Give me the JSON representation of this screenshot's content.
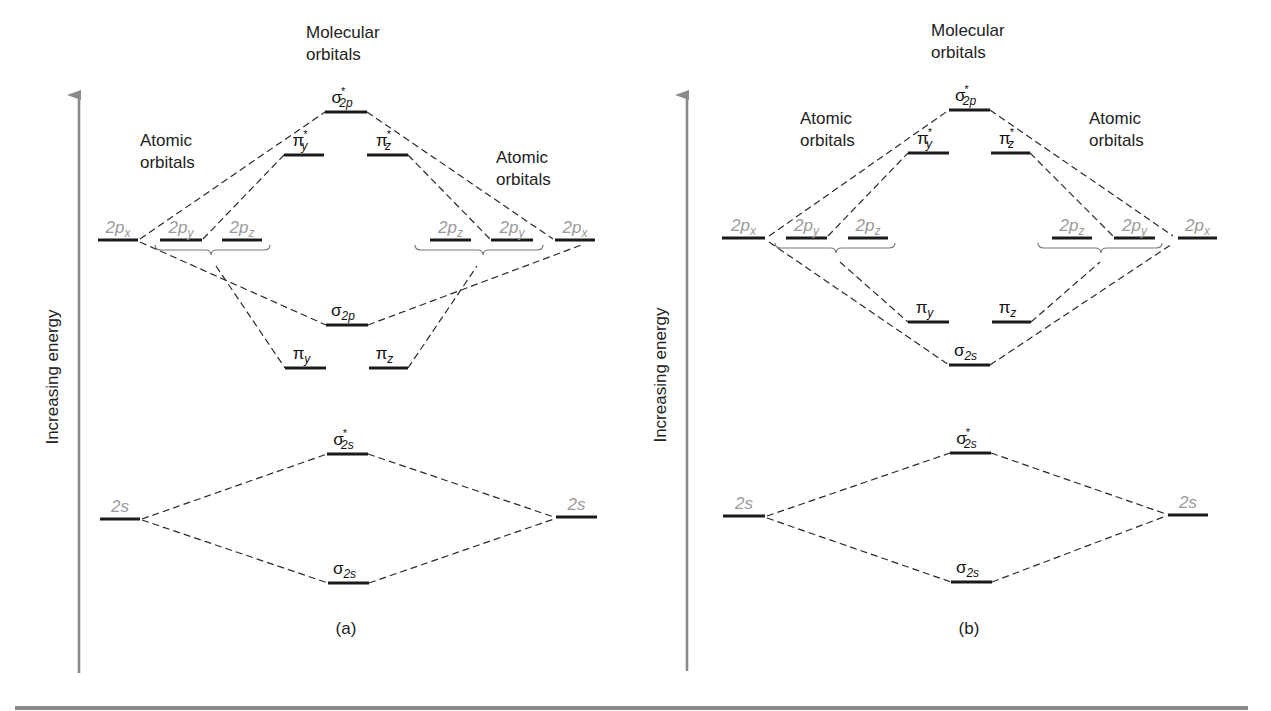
{
  "figure": {
    "axis_label": "Increasing energy",
    "bottom_rule": {
      "x1": 15,
      "x2": 1248,
      "y": 708,
      "color": "#8a8a8a"
    },
    "colors": {
      "level": "#1a1a1a",
      "connector": "#2a2a2a",
      "atomic_label": "#9a9a9a",
      "axis": "#8a8a8a"
    }
  },
  "panels": [
    {
      "id": "a",
      "caption": "(a)",
      "caption_pos": {
        "x": 346,
        "y": 634
      },
      "axis": {
        "x": 79,
        "y_top": 83,
        "y_bottom": 673,
        "label_x": 58,
        "label_y": 377
      },
      "headings": [
        {
          "text": [
            "Molecular",
            "orbitals"
          ],
          "x": 306,
          "y": 38
        },
        {
          "text": [
            "Atomic",
            "orbitals"
          ],
          "x": 140,
          "y": 146
        },
        {
          "text": [
            "Atomic",
            "orbitals"
          ],
          "x": 496,
          "y": 163
        }
      ],
      "atomic_orbitals": [
        {
          "name": "2px-left",
          "label": "2p",
          "sub": "x",
          "x1": 98,
          "x2": 138,
          "y": 240
        },
        {
          "name": "2py-left",
          "label": "2p",
          "sub": "y",
          "x1": 160,
          "x2": 202,
          "y": 240
        },
        {
          "name": "2pz-left",
          "label": "2p",
          "sub": "z",
          "x1": 222,
          "x2": 262,
          "y": 240
        },
        {
          "name": "2pz-right",
          "label": "2p",
          "sub": "z",
          "x1": 430,
          "x2": 471,
          "y": 240
        },
        {
          "name": "2py-right",
          "label": "2p",
          "sub": "y",
          "x1": 491,
          "x2": 533,
          "y": 240
        },
        {
          "name": "2px-right",
          "label": "2p",
          "sub": "x",
          "x1": 555,
          "x2": 595,
          "y": 240
        },
        {
          "name": "2s-left",
          "label": "2s",
          "sub": "",
          "x1": 100,
          "x2": 140,
          "y": 519
        },
        {
          "name": "2s-right",
          "label": "2s",
          "sub": "",
          "x1": 556,
          "x2": 597,
          "y": 517
        }
      ],
      "molecular_orbitals": [
        {
          "name": "sigma-star-2p",
          "symbol": "σ",
          "star": true,
          "sub": "2p",
          "x1": 325,
          "x2": 367,
          "y": 112
        },
        {
          "name": "pi-star-y",
          "symbol": "π",
          "star": true,
          "sub": "y",
          "x1": 284,
          "x2": 324,
          "y": 155
        },
        {
          "name": "pi-star-z",
          "symbol": "π",
          "star": true,
          "sub": "z",
          "x1": 367,
          "x2": 408,
          "y": 155
        },
        {
          "name": "sigma-2p",
          "symbol": "σ",
          "star": false,
          "sub": "2p",
          "x1": 326,
          "x2": 368,
          "y": 325
        },
        {
          "name": "pi-y",
          "symbol": "π",
          "star": false,
          "sub": "y",
          "x1": 285,
          "x2": 326,
          "y": 368
        },
        {
          "name": "pi-z",
          "symbol": "π",
          "star": false,
          "sub": "z",
          "x1": 369,
          "x2": 408,
          "y": 368
        },
        {
          "name": "sigma-star-2s",
          "symbol": "σ",
          "star": true,
          "sub": "2s",
          "x1": 327,
          "x2": 368,
          "y": 454
        },
        {
          "name": "sigma-2s",
          "symbol": "σ",
          "star": false,
          "sub": "2s",
          "x1": 328,
          "x2": 369,
          "y": 583
        }
      ],
      "braces": [
        {
          "x1": 155,
          "x2": 270,
          "y": 245,
          "mid": 211
        },
        {
          "x1": 415,
          "x2": 543,
          "y": 245,
          "mid": 483
        }
      ],
      "connectors": [
        [
          140,
          239,
          325,
          112
        ],
        [
          367,
          112,
          553,
          239
        ],
        [
          203,
          239,
          284,
          155
        ],
        [
          408,
          155,
          490,
          239
        ],
        [
          140,
          242,
          326,
          325
        ],
        [
          368,
          325,
          584,
          244
        ],
        [
          216,
          266,
          285,
          368
        ],
        [
          408,
          368,
          477,
          266
        ],
        [
          142,
          519,
          327,
          454
        ],
        [
          368,
          454,
          554,
          517
        ],
        [
          142,
          520,
          328,
          583
        ],
        [
          369,
          583,
          554,
          519
        ]
      ]
    },
    {
      "id": "b",
      "caption": "(b)",
      "caption_pos": {
        "x": 969,
        "y": 634
      },
      "axis": {
        "x": 687,
        "y_top": 83,
        "y_bottom": 671,
        "label_x": 666,
        "label_y": 375
      },
      "headings": [
        {
          "text": [
            "Molecular",
            "orbitals"
          ],
          "x": 931,
          "y": 36
        },
        {
          "text": [
            "Atomic",
            "orbitals"
          ],
          "x": 800,
          "y": 124
        },
        {
          "text": [
            "Atomic",
            "orbitals"
          ],
          "x": 1089,
          "y": 124
        }
      ],
      "atomic_orbitals": [
        {
          "name": "2px-left",
          "label": "2p",
          "sub": "x",
          "x1": 722,
          "x2": 765,
          "y": 238
        },
        {
          "name": "2py-left",
          "label": "2p",
          "sub": "y",
          "x1": 786,
          "x2": 827,
          "y": 238
        },
        {
          "name": "2pz-left",
          "label": "2p",
          "sub": "z",
          "x1": 848,
          "x2": 888,
          "y": 238
        },
        {
          "name": "2pz-right",
          "label": "2p",
          "sub": "z",
          "x1": 1052,
          "x2": 1092,
          "y": 238
        },
        {
          "name": "2py-right",
          "label": "2p",
          "sub": "y",
          "x1": 1114,
          "x2": 1155,
          "y": 238
        },
        {
          "name": "2px-right",
          "label": "2p",
          "sub": "x",
          "x1": 1178,
          "x2": 1217,
          "y": 238
        },
        {
          "name": "2s-left",
          "label": "2s",
          "sub": "",
          "x1": 723,
          "x2": 765,
          "y": 516
        },
        {
          "name": "2s-right",
          "label": "2s",
          "sub": "",
          "x1": 1168,
          "x2": 1208,
          "y": 515
        }
      ],
      "molecular_orbitals": [
        {
          "name": "sigma-star-2p",
          "symbol": "σ",
          "star": true,
          "sub": "2p",
          "x1": 949,
          "x2": 990,
          "y": 110
        },
        {
          "name": "pi-star-y",
          "symbol": "π",
          "star": true,
          "sub": "y",
          "x1": 908,
          "x2": 949,
          "y": 153
        },
        {
          "name": "pi-star-z",
          "symbol": "π",
          "star": true,
          "sub": "z",
          "x1": 991,
          "x2": 1030,
          "y": 153
        },
        {
          "name": "pi-y",
          "symbol": "π",
          "star": false,
          "sub": "y",
          "x1": 908,
          "x2": 949,
          "y": 322
        },
        {
          "name": "pi-z",
          "symbol": "π",
          "star": false,
          "sub": "z",
          "x1": 992,
          "x2": 1031,
          "y": 322
        },
        {
          "name": "sigma-2p-labelled-2s",
          "symbol": "σ",
          "star": false,
          "sub": "2s",
          "x1": 949,
          "x2": 990,
          "y": 365
        },
        {
          "name": "sigma-star-2s",
          "symbol": "σ",
          "star": true,
          "sub": "2s",
          "x1": 950,
          "x2": 991,
          "y": 453
        },
        {
          "name": "sigma-2s",
          "symbol": "σ",
          "star": false,
          "sub": "2s",
          "x1": 951,
          "x2": 992,
          "y": 582
        }
      ],
      "braces": [
        {
          "x1": 775,
          "x2": 895,
          "y": 243,
          "mid": 836
        },
        {
          "x1": 1038,
          "x2": 1162,
          "y": 243,
          "mid": 1101
        }
      ],
      "connectors": [
        [
          769,
          236,
          949,
          110
        ],
        [
          990,
          110,
          1173,
          236
        ],
        [
          828,
          236,
          908,
          153
        ],
        [
          1030,
          153,
          1113,
          236
        ],
        [
          769,
          242,
          949,
          365
        ],
        [
          990,
          365,
          1172,
          244
        ],
        [
          840,
          262,
          908,
          322
        ],
        [
          1031,
          322,
          1100,
          262
        ],
        [
          767,
          516,
          950,
          453
        ],
        [
          991,
          453,
          1166,
          514
        ],
        [
          767,
          518,
          951,
          582
        ],
        [
          992,
          582,
          1166,
          516
        ]
      ]
    }
  ]
}
